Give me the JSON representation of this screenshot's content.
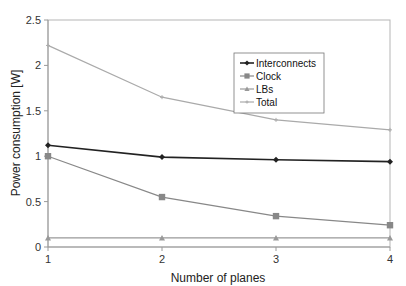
{
  "chart_data": {
    "type": "line",
    "title": "",
    "xlabel": "Number of planes",
    "ylabel": "Power consumption [W]",
    "x": [
      1,
      2,
      3,
      4
    ],
    "categories": [
      "1",
      "2",
      "3",
      "4"
    ],
    "ylim": [
      0,
      2.5
    ],
    "yticks": [
      "0",
      "0.5",
      "1",
      "1.5",
      "2",
      "2.5"
    ],
    "grid": false,
    "legend_position": "upper right (inside plot)",
    "series": [
      {
        "name": "Interconnects",
        "values": [
          1.12,
          0.99,
          0.96,
          0.94
        ],
        "marker": "diamond",
        "color": "#222222"
      },
      {
        "name": "Clock",
        "values": [
          1.0,
          0.55,
          0.34,
          0.24
        ],
        "marker": "square",
        "color": "#888888"
      },
      {
        "name": "LBs",
        "values": [
          0.1,
          0.1,
          0.1,
          0.1
        ],
        "marker": "triangle",
        "color": "#999999"
      },
      {
        "name": "Total",
        "values": [
          2.22,
          1.65,
          1.4,
          1.29
        ],
        "marker": "cross",
        "color": "#aaaaaa"
      }
    ]
  },
  "legend": {
    "items": [
      "Interconnects",
      "Clock",
      "LBs",
      "Total"
    ]
  },
  "axes": {
    "x_title": "Number of planes",
    "y_title": "Power consumption [W]"
  }
}
